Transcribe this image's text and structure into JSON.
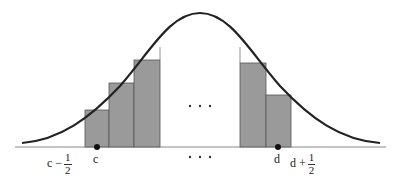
{
  "diagram": {
    "title": "",
    "colors": {
      "curve": "#222222",
      "bar_fill": "#9a9a9a",
      "bar_stroke": "#555555",
      "axis": "#8a8a8a",
      "point": "#111111"
    },
    "ellipsis_middle": "...",
    "ellipsis_axis": "...",
    "labels": {
      "c_minus_half": {
        "base": "c −",
        "num": "1",
        "den": "2"
      },
      "c": "c",
      "d": "d",
      "d_plus_half": {
        "base": "d +",
        "num": "1",
        "den": "2"
      }
    },
    "bars_left": [
      {
        "x0": 85,
        "x1": 109,
        "top": 110
      },
      {
        "x0": 109,
        "x1": 134,
        "top": 83
      },
      {
        "x0": 134,
        "x1": 160,
        "top": 60
      }
    ],
    "bars_right": [
      {
        "x0": 240,
        "x1": 266,
        "top": 63
      },
      {
        "x0": 266,
        "x1": 291,
        "top": 95
      }
    ]
  }
}
